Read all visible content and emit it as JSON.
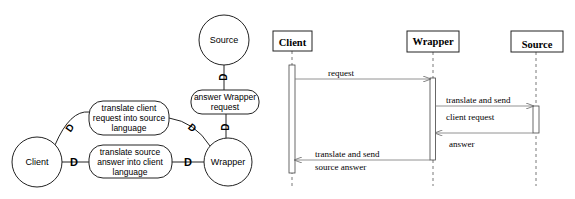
{
  "left_diagram": {
    "nodes": {
      "source": "Source",
      "wrapper": "Wrapper",
      "client": "Client"
    },
    "processes": {
      "answer_wrapper_request": [
        "answer Wrapper",
        "request"
      ],
      "translate_client_request": [
        "translate client",
        "request into source",
        "language"
      ],
      "translate_source_answer": [
        "translate source",
        "answer into client",
        "language"
      ]
    },
    "connector_markers": [
      "D",
      "D",
      "D",
      "D",
      "D",
      "D"
    ]
  },
  "sequence_diagram": {
    "participants": {
      "client": "Client",
      "wrapper": "Wrapper",
      "source": "Source"
    },
    "messages": {
      "request": "request",
      "translate_send_1": "translate and send",
      "client_request": "client request",
      "answer": "answer",
      "translate_send_2": "translate and send",
      "source_answer": "source answer"
    }
  },
  "colors": {
    "line": "#222222",
    "arrow": "#777777",
    "background": "#ffffff"
  }
}
